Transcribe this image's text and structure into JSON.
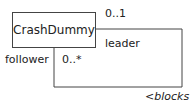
{
  "diagram": {
    "class": {
      "name": "CrashDummy"
    },
    "association": {
      "type": "self-association",
      "ends": [
        {
          "role": "leader",
          "multiplicity": "0..1"
        },
        {
          "role": "follower",
          "multiplicity": "0..*"
        }
      ],
      "name": "<blocks"
    }
  }
}
